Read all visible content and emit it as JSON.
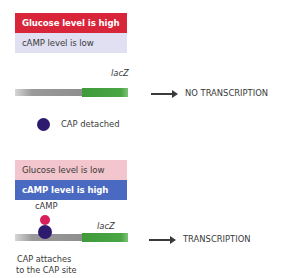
{
  "panel_top": {
    "glucose_label": "Glucose level is high",
    "camp_label": "cAMP level is low",
    "gene_label": "lacZ",
    "result_label": "NO TRANSCRIPTION",
    "cap_label": "CAP detached",
    "colors": {
      "glucose_box": "#d9253a",
      "camp_box": "#e0e0f2",
      "cap": "#2e1a6e",
      "gene": "#4aa544",
      "dna": "#8e8e8e"
    }
  },
  "panel_bottom": {
    "glucose_label": "Glucose level is low",
    "camp_label": "cAMP level is high",
    "camp_molecule_label": "cAMP",
    "gene_label": "lacZ",
    "result_label": "TRANSCRIPTION",
    "cap_label_line1": "CAP attaches",
    "cap_label_line2": "to the CAP site",
    "colors": {
      "glucose_box": "#f2c6cc",
      "camp_box": "#4a69c0",
      "camp_molecule": "#d81e5b",
      "cap": "#2e1a6e",
      "gene": "#4aa544",
      "dna": "#8e8e8e"
    }
  }
}
